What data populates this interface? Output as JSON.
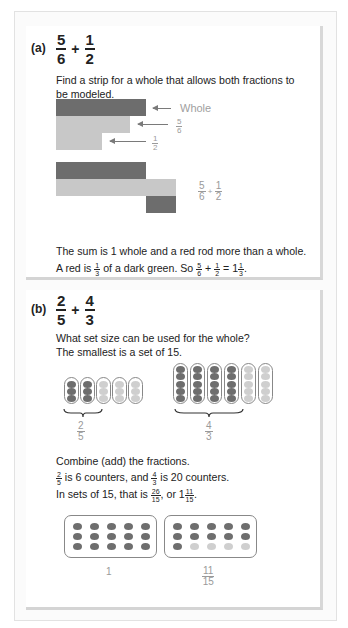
{
  "part_a": {
    "label": "(a)",
    "problem": {
      "frac1": {
        "num": "5",
        "den": "6"
      },
      "op": "+",
      "frac2": {
        "num": "1",
        "den": "2"
      }
    },
    "instruction": [
      "Find a strip for a whole that allows both fractions to",
      "be modeled."
    ],
    "strips_model": {
      "whole_label": "Whole",
      "five_sixths": {
        "num": "5",
        "den": "6"
      },
      "one_half": {
        "num": "1",
        "den": "2"
      }
    },
    "sum_model": {
      "label": {
        "frac1": {
          "num": "5",
          "den": "6"
        },
        "op": "+",
        "frac2": {
          "num": "1",
          "den": "2"
        }
      }
    },
    "conclusion_line1": "The sum is 1 whole and a red rod more than a whole.",
    "conclusion_line2": {
      "t1": "A red is ",
      "f1": {
        "num": "1",
        "den": "3"
      },
      "t2": " of a dark green. So ",
      "f2": {
        "num": "5",
        "den": "6"
      },
      "plus": " + ",
      "f3": {
        "num": "1",
        "den": "2"
      },
      "eq": " = 1",
      "f4": {
        "num": "1",
        "den": "3"
      },
      "end": "."
    }
  },
  "part_b": {
    "label": "(b)",
    "problem": {
      "frac1": {
        "num": "2",
        "den": "5"
      },
      "op": "+",
      "frac2": {
        "num": "4",
        "den": "3"
      }
    },
    "instruction": [
      "What set size can be used for the whole?",
      "The smallest is a set of 15."
    ],
    "set_models": {
      "two_fifths": {
        "num": "2",
        "den": "5",
        "rods": 5,
        "counters_per_rod": 3,
        "shaded_rods": 2
      },
      "four_thirds": {
        "num": "4",
        "den": "3",
        "rods": 6,
        "counters_per_rod": 5,
        "shaded_rods": 4
      }
    },
    "combine_text": "Combine (add) the fractions.",
    "counters_line": {
      "f1": {
        "num": "2",
        "den": "5"
      },
      "t1": " is 6 counters, and ",
      "f2": {
        "num": "4",
        "den": "3"
      },
      "t2": " is 20 counters."
    },
    "sets_line": {
      "t1": "In sets of 15, that is ",
      "f1": {
        "num": "26",
        "den": "15"
      },
      "t2": ", or 1",
      "f2": {
        "num": "11",
        "den": "15"
      },
      "end": "."
    },
    "result_sets": {
      "whole_label": "1",
      "remainder_label": {
        "num": "11",
        "den": "15"
      },
      "whole_shaded": 15,
      "remainder_shaded": 11,
      "set_size": 15
    }
  },
  "colors": {
    "dark": "#6d6d6d",
    "light": "#c8c8c8",
    "label_gray": "#a0a0a0"
  }
}
